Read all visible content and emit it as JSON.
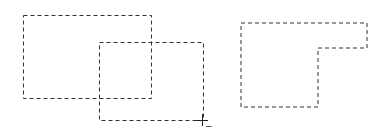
{
  "canvas": {
    "width": 388,
    "height": 140,
    "background": "#ffffff",
    "stroke_color": "#333333",
    "dash": "4,3"
  },
  "selections": [
    {
      "name": "selection-rect-1",
      "type": "rect",
      "x": 23,
      "y": 15,
      "w": 128,
      "h": 83
    },
    {
      "name": "selection-rect-2",
      "type": "rect",
      "x": 99,
      "y": 42,
      "w": 104,
      "h": 78
    },
    {
      "name": "selection-result-shape",
      "type": "polygon",
      "points": "241,23 367,23 367,48 318,48 318,107 241,107"
    }
  ],
  "cursor": {
    "name": "crosshair-subtract-cursor",
    "x": 202,
    "y": 120,
    "modifier": "−"
  }
}
